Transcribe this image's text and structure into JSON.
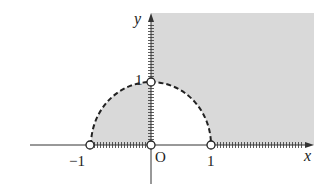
{
  "diagram": {
    "type": "region-in-plane",
    "axes": {
      "x_label": "x",
      "y_label": "y",
      "origin_label": "O"
    },
    "ticks": {
      "x_neg1": "−1",
      "x_pos1": "1",
      "y_pos1": "1"
    },
    "curves": [
      {
        "name": "unit-semicircle-upper",
        "style": "dashed",
        "equation": "x^2 + y^2 = 1, y >= 0"
      }
    ],
    "shaded_regions": [
      {
        "name": "first-quadrant-outside-circle",
        "description": "x > 0, y > 0, x^2 + y^2 > 1"
      },
      {
        "name": "second-quadrant-inside-circle",
        "description": "x < 0, y > 0, x^2 + y^2 < 1"
      }
    ],
    "boundary_marks": {
      "x_axis_hatched": [
        "-1 < x < 0",
        "x > 1"
      ],
      "y_axis_hatched": [
        "0 < y < 1",
        "y > 1"
      ]
    },
    "open_points": [
      {
        "label": "(-1, 0)"
      },
      {
        "label": "(0, 0)"
      },
      {
        "label": "(1, 0)"
      },
      {
        "label": "(0, 1)"
      }
    ],
    "colors": {
      "shade": "#d9d9d9",
      "line": "#222222"
    }
  }
}
